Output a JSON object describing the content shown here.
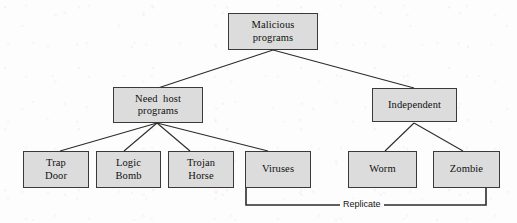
{
  "figure": {
    "colors": {
      "node_fill": "#dcdcdc",
      "node_border": "#3a3a3a",
      "edge": "#2b2b2b",
      "background": "#fdfdfd",
      "text": "#101010"
    }
  },
  "nodes": {
    "root": {
      "line1": "Malicious",
      "line2": "programs"
    },
    "need_host": {
      "line1": "Need  host",
      "line2": "programs"
    },
    "independent": {
      "line1": "Independent",
      "line2": ""
    },
    "trap_door": {
      "line1": "Trap",
      "line2": "Door"
    },
    "logic_bomb": {
      "line1": "Logic",
      "line2": "Bomb"
    },
    "trojan_horse": {
      "line1": "Trojan",
      "line2": "Horse"
    },
    "viruses": {
      "line1": "Viruses",
      "line2": ""
    },
    "worm": {
      "line1": "Worm",
      "line2": ""
    },
    "zombie": {
      "line1": "Zombie",
      "line2": ""
    }
  },
  "annotations": {
    "replicate": "Replicate"
  }
}
